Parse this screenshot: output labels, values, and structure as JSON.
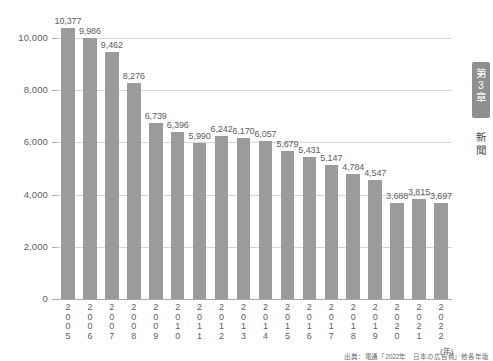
{
  "chart_data": {
    "type": "bar",
    "title": "",
    "xlabel": "(年)",
    "ylabel": "",
    "ylim": [
      0,
      10000
    ],
    "ytick_values": [
      0,
      2000,
      4000,
      6000,
      8000,
      10000
    ],
    "ytick_labels": [
      "0",
      "2,000",
      "4,000",
      "6,000",
      "8,000",
      "10,000"
    ],
    "grid": true,
    "legend": "none",
    "bar_color": "#9b9b9b",
    "categories": [
      "2005",
      "2006",
      "2007",
      "2008",
      "2009",
      "2010",
      "2011",
      "2012",
      "2013",
      "2014",
      "2015",
      "2016",
      "2017",
      "2018",
      "2019",
      "2020",
      "2021",
      "2022"
    ],
    "values": [
      10377,
      9986,
      9462,
      8276,
      6739,
      6396,
      5990,
      6242,
      6170,
      6057,
      5679,
      5431,
      5147,
      4784,
      4547,
      3688,
      3815,
      3697
    ],
    "data_labels": [
      "10,377",
      "9,986",
      "9,462",
      "8,276",
      "6,739",
      "6,396",
      "5,990",
      "6,242",
      "6,170",
      "6,057",
      "5,679",
      "5,431",
      "5,147",
      "4,784",
      "4,547",
      "3,688",
      "3,815",
      "3,697"
    ],
    "source": "出典：電通「2022年　日本の広告費」他各年版"
  },
  "sidebar": {
    "chapter_tab": [
      "第",
      "3",
      "章"
    ],
    "section_label": [
      "新",
      "聞"
    ]
  }
}
